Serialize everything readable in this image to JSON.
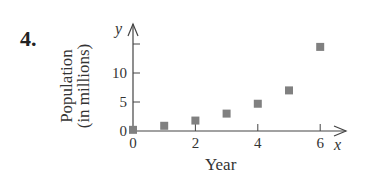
{
  "problem_number": "4.",
  "chart_data": {
    "type": "scatter",
    "title": "",
    "xlabel": "Year",
    "ylabel": "Population (in millions)",
    "ylabel_lines": [
      "Population",
      "(in millions)"
    ],
    "x_axis_name": "x",
    "y_axis_name": "y",
    "x_ticks": [
      0,
      2,
      4,
      6
    ],
    "y_ticks": [
      0,
      5,
      10
    ],
    "xlim": [
      0,
      6.8
    ],
    "ylim": [
      0,
      17
    ],
    "grid": false,
    "marker": "square",
    "marker_color": "#808080",
    "x": [
      0,
      1,
      2,
      3,
      4,
      5,
      6
    ],
    "y": [
      0.2,
      0.9,
      1.8,
      3.0,
      4.7,
      7.0,
      14.5
    ]
  }
}
